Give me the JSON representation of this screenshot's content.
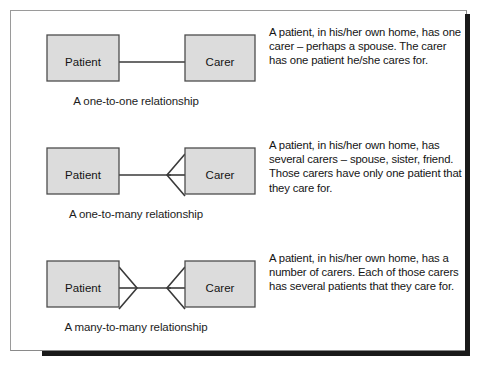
{
  "figure": {
    "kind": "entity-relationship-diagram-figure",
    "colors": {
      "box_fill": "#dcdcdc",
      "box_stroke": "#4d4d4d",
      "line": "#3a3a3a",
      "text": "#141414",
      "frame": "#9a9a9a",
      "frame_shadow": "#1a1a1a"
    },
    "rows": [
      {
        "left_entity": "Patient",
        "right_entity": "Carer",
        "left_cardinality": "one",
        "right_cardinality": "one",
        "caption": "A one-to-one relationship",
        "description": "A patient, in his/her own home, has one carer – perhaps a spouse. The carer has one patient he/she cares for."
      },
      {
        "left_entity": "Patient",
        "right_entity": "Carer",
        "left_cardinality": "one",
        "right_cardinality": "many",
        "caption": "A one-to-many relationship",
        "description": "A patient, in his/her own home, has several carers – spouse, sister, friend. Those carers have only one patient that they care for."
      },
      {
        "left_entity": "Patient",
        "right_entity": "Carer",
        "left_cardinality": "many",
        "right_cardinality": "many",
        "caption": "A many-to-many relationship",
        "description": "A patient, in his/her own home, has a number of carers. Each of those carers has several patients that they care for."
      }
    ]
  }
}
